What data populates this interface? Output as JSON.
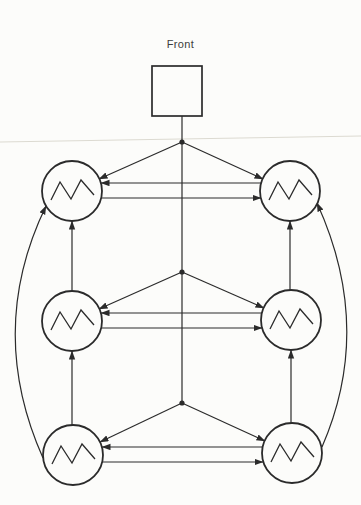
{
  "page": {
    "background": "#fcfcfa",
    "ink_color": "#2b2b2b",
    "crease_color": "#dcdad1"
  },
  "diagram": {
    "title": "Front",
    "canvas": {
      "width": 361,
      "height": 505
    },
    "front_box": {
      "id": "front-box",
      "x": 152,
      "y": 66,
      "width": 50,
      "height": 50
    },
    "nodes": [
      {
        "id": "oscillator-top-left",
        "cx": 72,
        "cy": 191,
        "r": 30,
        "symbol": "zigzag"
      },
      {
        "id": "oscillator-top-right",
        "cx": 290,
        "cy": 191,
        "r": 30,
        "symbol": "zigzag"
      },
      {
        "id": "oscillator-middle-left",
        "cx": 72,
        "cy": 321,
        "r": 30,
        "symbol": "zigzag"
      },
      {
        "id": "oscillator-middle-right",
        "cx": 291,
        "cy": 320,
        "r": 30,
        "symbol": "zigzag"
      },
      {
        "id": "oscillator-bottom-left",
        "cx": 73,
        "cy": 455,
        "r": 30,
        "symbol": "zigzag"
      },
      {
        "id": "oscillator-bottom-right",
        "cx": 292,
        "cy": 453,
        "r": 30,
        "symbol": "zigzag"
      }
    ],
    "zigzag_points": [
      [
        -21,
        9
      ],
      [
        -12,
        -9
      ],
      [
        -1,
        8
      ],
      [
        9,
        -11
      ],
      [
        22,
        4
      ]
    ],
    "junction_dots": [
      {
        "x": 182,
        "y": 142
      },
      {
        "x": 182,
        "y": 272
      },
      {
        "x": 182,
        "y": 403
      }
    ],
    "edges": [
      {
        "name": "trunk-line",
        "x1": 182,
        "y1": 116,
        "x2": 182,
        "y2": 403,
        "arrow": false
      },
      {
        "name": "fan-row1-to-left",
        "x1": 182,
        "y1": 142,
        "x2": 99,
        "y2": 179,
        "arrow": true
      },
      {
        "name": "fan-row1-to-right",
        "x1": 182,
        "y1": 142,
        "x2": 263,
        "y2": 179,
        "arrow": true
      },
      {
        "name": "fan-row2-to-left",
        "x1": 182,
        "y1": 272,
        "x2": 99,
        "y2": 309,
        "arrow": true
      },
      {
        "name": "fan-row2-to-right",
        "x1": 182,
        "y1": 272,
        "x2": 264,
        "y2": 308,
        "arrow": true
      },
      {
        "name": "fan-row3-to-left",
        "x1": 182,
        "y1": 403,
        "x2": 100,
        "y2": 442,
        "arrow": true
      },
      {
        "name": "fan-row3-to-right",
        "x1": 182,
        "y1": 403,
        "x2": 265,
        "y2": 441,
        "arrow": true
      },
      {
        "name": "row1-right-to-left",
        "x1": 261,
        "y1": 183,
        "x2": 101,
        "y2": 183,
        "arrow": true
      },
      {
        "name": "row1-left-to-right",
        "x1": 101,
        "y1": 198,
        "x2": 261,
        "y2": 198,
        "arrow": true
      },
      {
        "name": "row2-right-to-left",
        "x1": 262,
        "y1": 313,
        "x2": 101,
        "y2": 313,
        "arrow": true
      },
      {
        "name": "row2-left-to-right",
        "x1": 101,
        "y1": 328,
        "x2": 262,
        "y2": 328,
        "arrow": true
      },
      {
        "name": "row3-right-to-left",
        "x1": 263,
        "y1": 447,
        "x2": 102,
        "y2": 447,
        "arrow": true
      },
      {
        "name": "row3-left-to-right",
        "x1": 102,
        "y1": 462,
        "x2": 263,
        "y2": 462,
        "arrow": true
      },
      {
        "name": "left-middle-to-top",
        "x1": 72,
        "y1": 291,
        "x2": 72,
        "y2": 221,
        "arrow": true
      },
      {
        "name": "left-bottom-to-middle",
        "x1": 72,
        "y1": 425,
        "x2": 72,
        "y2": 351,
        "arrow": true
      },
      {
        "name": "right-middle-to-top",
        "x1": 290,
        "y1": 290,
        "x2": 290,
        "y2": 221,
        "arrow": true
      },
      {
        "name": "right-bottom-to-middle",
        "x1": 291,
        "y1": 423,
        "x2": 291,
        "y2": 350,
        "arrow": true
      }
    ],
    "curved_edges": [
      {
        "name": "outer-left-curve",
        "d": "M 43 458 Q -14 330 46 206",
        "arrow": true
      },
      {
        "name": "outer-right-curve",
        "d": "M 322 447 Q 374 328 317 203",
        "arrow": true
      }
    ],
    "crease_line": {
      "x1": 0,
      "y1": 142,
      "x2": 361,
      "y2": 136
    }
  }
}
